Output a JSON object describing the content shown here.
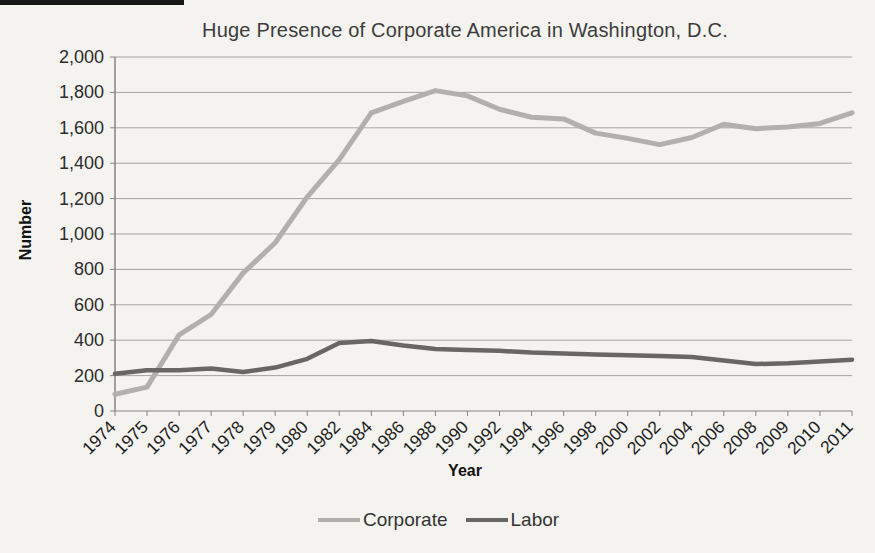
{
  "page": {
    "background": "#f4f3f0"
  },
  "chart_data": {
    "type": "line",
    "title": "Huge Presence of Corporate America in Washington, D.C.",
    "xlabel": "Year",
    "ylabel": "Number",
    "ylim": [
      0,
      2000
    ],
    "ytick_step": 200,
    "y_tick_labels": [
      "0",
      "200",
      "400",
      "600",
      "800",
      "1,000",
      "1,200",
      "1,400",
      "1,600",
      "1,800",
      "2,000"
    ],
    "categories": [
      "1974",
      "1975",
      "1976",
      "1977",
      "1978",
      "1979",
      "1980",
      "1982",
      "1984",
      "1986",
      "1988",
      "1990",
      "1992",
      "1994",
      "1996",
      "1998",
      "2000",
      "2002",
      "2004",
      "2006",
      "2008",
      "2009",
      "2010",
      "2011"
    ],
    "series": [
      {
        "name": "Corporate",
        "color": "#b2b0ac",
        "width": 5,
        "values": [
          95,
          135,
          430,
          545,
          780,
          950,
          1210,
          1420,
          1685,
          1750,
          1810,
          1780,
          1705,
          1660,
          1650,
          1570,
          1540,
          1505,
          1545,
          1620,
          1595,
          1605,
          1625,
          1685
        ]
      },
      {
        "name": "Labor",
        "color": "#696763",
        "width": 4.5,
        "values": [
          210,
          230,
          230,
          240,
          220,
          245,
          295,
          385,
          395,
          370,
          350,
          345,
          340,
          330,
          325,
          320,
          315,
          310,
          305,
          285,
          265,
          270,
          280,
          290
        ]
      }
    ],
    "grid": true,
    "legend_position": "bottom"
  }
}
